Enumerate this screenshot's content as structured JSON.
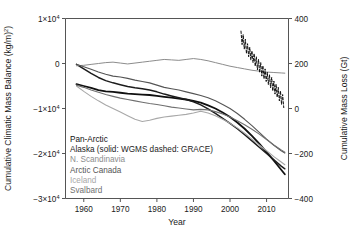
{
  "chart_data": {
    "type": "line",
    "title": "",
    "xlabel": "Year",
    "ylabel": "Cumulative Climatic Mass Balance (kg/m²)",
    "y2label": "Cumulative Mass Loss (Gt)",
    "xlim": [
      1955,
      2016
    ],
    "ylim": [
      -30000,
      10000
    ],
    "y2lim": [
      -400,
      400
    ],
    "grid": false,
    "legend_position": "lower-left-inside",
    "xticks": [
      1960,
      1970,
      1980,
      1990,
      2000,
      2010
    ],
    "xticklabels": [
      "1960",
      "1970",
      "1980",
      "1990",
      "2000",
      "2010"
    ],
    "yticks": [
      10000,
      0,
      -10000,
      -20000,
      -30000
    ],
    "yticklabels": [
      "1×10⁴",
      "0",
      "−1×10⁴",
      "−2×10⁴",
      "−3×10⁴"
    ],
    "y2ticks": [
      400,
      200,
      0,
      -200,
      -400
    ],
    "y2ticklabels": [
      "400",
      "200",
      "0",
      "−200",
      "−400"
    ],
    "series": [
      {
        "name": "Pan-Arctic",
        "color": "#101010",
        "width": 1.8,
        "dash": "none",
        "x": [
          1958,
          1960,
          1962,
          1964,
          1966,
          1968,
          1970,
          1972,
          1974,
          1976,
          1978,
          1980,
          1982,
          1984,
          1986,
          1988,
          1990,
          1992,
          1994,
          1996,
          1998,
          2000,
          2002,
          2004,
          2006,
          2008,
          2010,
          2012,
          2014,
          2015
        ],
        "values": [
          -4600,
          -5000,
          -5400,
          -5900,
          -6200,
          -6300,
          -6500,
          -6700,
          -6800,
          -6900,
          -7000,
          -7200,
          -7400,
          -7600,
          -7800,
          -8000,
          -8300,
          -8700,
          -9300,
          -10000,
          -10900,
          -11900,
          -13100,
          -14500,
          -16100,
          -17800,
          -19700,
          -21600,
          -23600,
          -24600
        ]
      },
      {
        "name": "Alaska (solid: WGMS dashed: GRACE)",
        "color": "#1c1c1c",
        "width": 1.5,
        "dash": "none",
        "x": [
          1958,
          1960,
          1962,
          1964,
          1966,
          1968,
          1970,
          1972,
          1974,
          1976,
          1978,
          1980,
          1982,
          1984,
          1986,
          1988,
          1990,
          1992,
          1994,
          1996,
          1998,
          2000,
          2002,
          2004,
          2006,
          2008,
          2010,
          2012,
          2014,
          2015
        ],
        "values": [
          -200,
          -1200,
          -2200,
          -3100,
          -3800,
          -4300,
          -4700,
          -5100,
          -5400,
          -5600,
          -5900,
          -6300,
          -6800,
          -7200,
          -7600,
          -8000,
          -8500,
          -9200,
          -10100,
          -11100,
          -12200,
          -13300,
          -14500,
          -15800,
          -17200,
          -18600,
          -20000,
          -21400,
          -22800,
          -23400
        ]
      },
      {
        "name": "N. Scandinavia",
        "color": "#8c8c8c",
        "width": 1.0,
        "dash": "none",
        "x": [
          1958,
          1960,
          1962,
          1964,
          1966,
          1968,
          1970,
          1972,
          1974,
          1976,
          1978,
          1980,
          1982,
          1984,
          1986,
          1988,
          1990,
          1992,
          1994,
          1996,
          1998,
          2000,
          2002,
          2004,
          2006,
          2008,
          2010,
          2012,
          2014,
          2015
        ],
        "values": [
          -500,
          -400,
          -200,
          0,
          200,
          300,
          100,
          -100,
          100,
          300,
          500,
          700,
          900,
          800,
          700,
          900,
          1100,
          900,
          600,
          200,
          -200,
          -600,
          -900,
          -1200,
          -1500,
          -1700,
          -1900,
          -2000,
          -2100,
          -2150
        ]
      },
      {
        "name": "Arctic Canada",
        "color": "#555555",
        "width": 1.1,
        "dash": "none",
        "x": [
          1958,
          1960,
          1962,
          1964,
          1966,
          1968,
          1970,
          1972,
          1974,
          1976,
          1978,
          1980,
          1982,
          1984,
          1986,
          1988,
          1990,
          1992,
          1994,
          1996,
          1998,
          2000,
          2002,
          2004,
          2006,
          2008,
          2010,
          2012,
          2014,
          2015
        ],
        "values": [
          -150,
          -700,
          -1300,
          -1900,
          -2400,
          -2800,
          -3000,
          -3300,
          -3700,
          -4000,
          -4300,
          -4800,
          -5300,
          -5600,
          -5900,
          -6300,
          -6700,
          -7100,
          -7600,
          -8300,
          -9100,
          -10000,
          -11100,
          -12400,
          -13800,
          -15300,
          -16800,
          -18200,
          -19400,
          -19900
        ]
      },
      {
        "name": "Iceland",
        "color": "#a8a8a8",
        "width": 1.1,
        "dash": "none",
        "x": [
          1958,
          1960,
          1962,
          1964,
          1966,
          1968,
          1970,
          1972,
          1974,
          1976,
          1978,
          1980,
          1982,
          1984,
          1986,
          1988,
          1990,
          1992,
          1994,
          1996,
          1998,
          2000,
          2002,
          2004,
          2006,
          2008,
          2010,
          2012,
          2014,
          2015
        ],
        "values": [
          -5000,
          -6200,
          -7300,
          -8300,
          -9200,
          -10000,
          -10800,
          -11600,
          -12400,
          -12900,
          -12600,
          -12200,
          -11900,
          -11700,
          -11500,
          -11300,
          -11000,
          -10600,
          -11000,
          -11600,
          -12400,
          -13300,
          -14300,
          -15500,
          -16800,
          -18100,
          -19400,
          -20700,
          -21900,
          -22500
        ]
      },
      {
        "name": "Svalbard",
        "color": "#707070",
        "width": 1.1,
        "dash": "none",
        "x": [
          1958,
          1960,
          1962,
          1964,
          1966,
          1968,
          1970,
          1972,
          1974,
          1976,
          1978,
          1980,
          1982,
          1984,
          1986,
          1988,
          1990,
          1992,
          1994,
          1996,
          1998,
          2000,
          2002,
          2004,
          2006,
          2008,
          2010,
          2012,
          2014,
          2015
        ],
        "values": [
          -4800,
          -5300,
          -5900,
          -6400,
          -6900,
          -7300,
          -7700,
          -8000,
          -8300,
          -8600,
          -8900,
          -9100,
          -9400,
          -9700,
          -9900,
          -10100,
          -10300,
          -10200,
          -10300,
          -10700,
          -11200,
          -11900,
          -12700,
          -13600,
          -14600,
          -15700,
          -16900,
          -18100,
          -19200,
          -19700
        ]
      },
      {
        "name": "Alaska GRACE",
        "color": "#101010",
        "width": 1.0,
        "dash": "2.4 1.8",
        "x": [
          2003.0,
          2003.3,
          2003.6,
          2003.9,
          2004.2,
          2004.5,
          2004.8,
          2005.1,
          2005.4,
          2005.7,
          2006.0,
          2006.3,
          2006.6,
          2006.9,
          2007.2,
          2007.5,
          2007.8,
          2008.1,
          2008.4,
          2008.7,
          2009.0,
          2009.3,
          2009.6,
          2009.9,
          2010.2,
          2010.5,
          2010.8,
          2011.1,
          2011.4,
          2011.7,
          2012.0,
          2012.3,
          2012.6,
          2012.9,
          2013.2,
          2013.5,
          2013.8,
          2014.1,
          2014.4,
          2014.7
        ],
        "values": [
          7200,
          4200,
          6400,
          3200,
          5400,
          2200,
          4400,
          1500,
          3600,
          800,
          2800,
          200,
          2200,
          -600,
          1500,
          -1400,
          900,
          -2000,
          200,
          -2800,
          -500,
          -3400,
          -1200,
          -4000,
          -1900,
          -4700,
          -2500,
          -5400,
          -3100,
          -6100,
          -3900,
          -6800,
          -4600,
          -7500,
          -5300,
          -8300,
          -6100,
          -9100,
          -6900,
          -9800
        ]
      }
    ],
    "legend": [
      {
        "label": "Pan-Arctic",
        "color": "#101010"
      },
      {
        "label": "Alaska (solid: WGMS dashed: GRACE)",
        "color": "#1c1c1c"
      },
      {
        "label": "N. Scandinavia",
        "color": "#8c8c8c"
      },
      {
        "label": "Arctic Canada",
        "color": "#555555"
      },
      {
        "label": "Iceland",
        "color": "#a8a8a8"
      },
      {
        "label": "Svalbard",
        "color": "#707070"
      }
    ]
  }
}
